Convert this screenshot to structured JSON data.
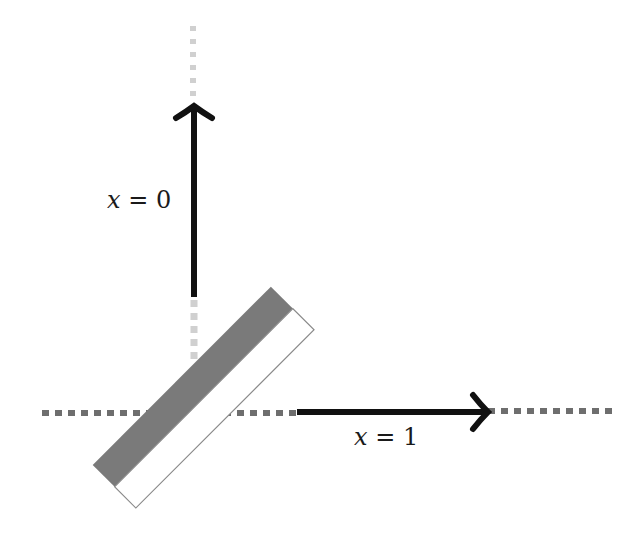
{
  "diagram": {
    "labels": {
      "vertical_arrow_label_var": "x",
      "vertical_arrow_label_rest": " = 0",
      "horizontal_arrow_label_var": "x",
      "horizontal_arrow_label_rest": " = 1"
    },
    "colors": {
      "arrow": "#111111",
      "horizontal_dots": "#6e6e6e",
      "vertical_dots": "#cfcfcf",
      "plate_dark": "#7a7a7a",
      "plate_light": "#ffffff",
      "plate_outline": "#8a8a8a"
    }
  }
}
